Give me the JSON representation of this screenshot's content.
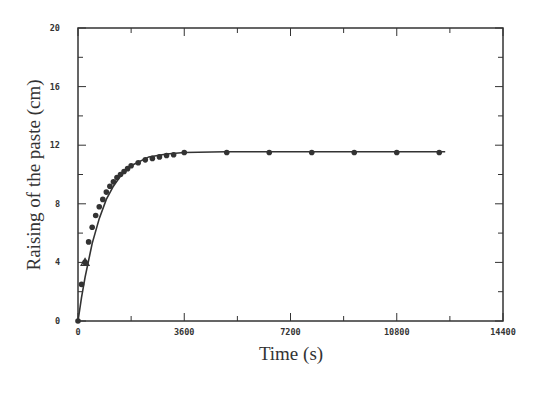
{
  "chart_data": {
    "type": "line",
    "title": "",
    "xlabel": "Time (s)",
    "ylabel": "Raising of the paste (cm)",
    "xlim": [
      0,
      14400
    ],
    "ylim": [
      0,
      20
    ],
    "xticks": [
      0,
      3600,
      7200,
      10800,
      14400
    ],
    "xtick_labels": [
      "0",
      "3600",
      "7200",
      "10800",
      "14400"
    ],
    "yticks": [
      0,
      4,
      8,
      12,
      16,
      20
    ],
    "ytick_labels": [
      "0",
      "4",
      "8",
      "12",
      "16",
      "20"
    ],
    "grid": false,
    "legend": null,
    "series": [
      {
        "name": "measured",
        "marker": "circle",
        "x": [
          0,
          120,
          240,
          360,
          480,
          600,
          720,
          840,
          960,
          1080,
          1200,
          1320,
          1440,
          1560,
          1680,
          1800,
          2040,
          2280,
          2520,
          2760,
          3000,
          3240,
          3600,
          5040,
          6480,
          7920,
          9360,
          10800,
          12240
        ],
        "y": [
          0,
          2.5,
          4.0,
          5.4,
          6.4,
          7.2,
          7.8,
          8.3,
          8.8,
          9.2,
          9.5,
          9.8,
          10.0,
          10.2,
          10.4,
          10.6,
          10.8,
          11.0,
          11.1,
          11.2,
          11.3,
          11.35,
          11.5,
          11.5,
          11.5,
          11.5,
          11.5,
          11.5,
          11.5
        ]
      },
      {
        "name": "fit",
        "marker": "none",
        "x": [
          0,
          120,
          240,
          480,
          720,
          960,
          1200,
          1440,
          1800,
          2400,
          3000,
          3600,
          5000,
          7200,
          10800,
          12440
        ],
        "y": [
          0,
          1.6,
          3.0,
          5.3,
          7.0,
          8.3,
          9.2,
          9.9,
          10.6,
          11.2,
          11.4,
          11.5,
          11.55,
          11.55,
          11.55,
          11.55
        ]
      }
    ],
    "annotations": [
      {
        "x": 240,
        "y": 4.0,
        "marker": "triangle"
      }
    ]
  }
}
